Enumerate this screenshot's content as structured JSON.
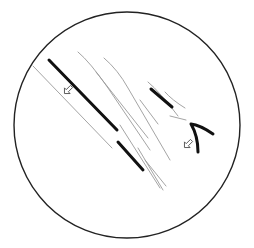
{
  "diagram": {
    "type": "microscope-field-sketch",
    "frame": {
      "shape": "circle",
      "cx": 127,
      "cy": 125,
      "r": 113,
      "stroke": "#222222"
    },
    "colors": {
      "bold_stroke": "#111111",
      "faint_stroke": "#9a9a9a",
      "outline": "#222222",
      "arrow": "#555555"
    },
    "elements": {
      "bold_lines": [
        {
          "id": "main-diagonal",
          "d": "M49 60 L117 130"
        },
        {
          "id": "lower-segment",
          "d": "M118 142 L143 170"
        },
        {
          "id": "upper-right-segment",
          "d": "M151 89 L172 107"
        },
        {
          "id": "chevron",
          "d": "M213 134 Q200 125 191 124 Q198 136 198 152"
        }
      ],
      "faint_lines": [
        {
          "id": "left-parallel",
          "d": "M33 66 L112 148"
        },
        {
          "id": "faint-1",
          "d": "M78 52 Q90 62 108 88 L150 150"
        },
        {
          "id": "faint-2",
          "d": "M104 58 Q118 70 128 88 L170 160"
        },
        {
          "id": "faint-3",
          "d": "M96 72 L148 138"
        },
        {
          "id": "faint-4",
          "d": "M148 82 Q160 92 178 116"
        },
        {
          "id": "faint-5",
          "d": "M140 100 L158 124"
        },
        {
          "id": "faint-6",
          "d": "M120 125 L160 188"
        },
        {
          "id": "faint-7",
          "d": "M138 148 L163 190"
        },
        {
          "id": "faint-8",
          "d": "M145 160 L166 186"
        },
        {
          "id": "faint-9",
          "d": "M165 92 Q172 100 185 108"
        },
        {
          "id": "faint-10",
          "d": "M170 116 L186 120"
        }
      ],
      "arrows": [
        {
          "id": "arrow-left",
          "x": 68,
          "y": 90,
          "rotation": 225,
          "label": "open-arrow"
        },
        {
          "id": "arrow-right",
          "x": 188,
          "y": 144,
          "rotation": 225,
          "label": "open-arrow"
        }
      ]
    }
  }
}
